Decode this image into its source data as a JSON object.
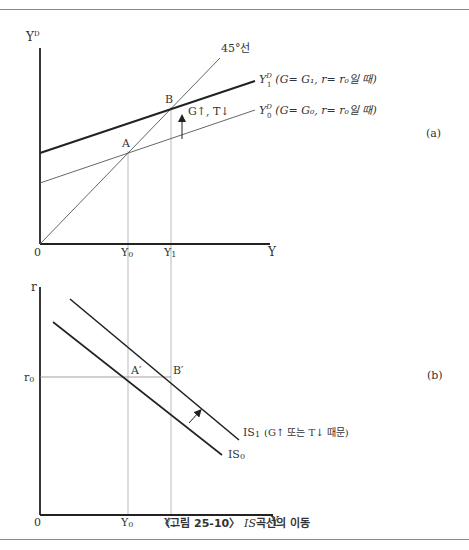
{
  "panel_a": {
    "tag": "(a)",
    "y_axis_label": "Y",
    "y_axis_sup": "D",
    "x_axis_label": "Y",
    "origin": "0",
    "line_45_label": "45°선",
    "point_a": "A",
    "point_b": "B",
    "y0_tick": "Y",
    "y0_sub": "0",
    "y1_tick": "Y",
    "y1_sub": "1",
    "shift_label": "G↑, T↓",
    "curve_1": {
      "main": "Y",
      "sup": "D",
      "sub": "1",
      "cond": "(G= G₁,  r= r₀일  때)"
    },
    "curve_0": {
      "main": "Y",
      "sup": "D",
      "sub": "0",
      "cond": "(G= G₀,  r= r₀일  때)"
    }
  },
  "panel_b": {
    "tag": "(b)",
    "y_axis_label": "r",
    "x_axis_label": "Y",
    "origin": "0",
    "r0_label": "r",
    "r0_sub": "0",
    "point_a": "A′",
    "point_b": "B′",
    "y0_tick": "Y",
    "y0_sub": "0",
    "y1_tick": "Y",
    "y1_sub": "1",
    "is1_label": "IS",
    "is1_sub": "1",
    "is1_note": "(G↑  또는  T↓ 때문)",
    "is0_label": "IS",
    "is0_sub": "0"
  },
  "caption": {
    "prefix": "〈그림 25-10〉 ",
    "is": "IS",
    "suffix": "곡선의 이동"
  },
  "colors": {
    "axis": "#222222",
    "thin_line": "#555555",
    "guide_line": "#aaaaaa",
    "text": "#333333",
    "frame": "#8a8a8a"
  }
}
